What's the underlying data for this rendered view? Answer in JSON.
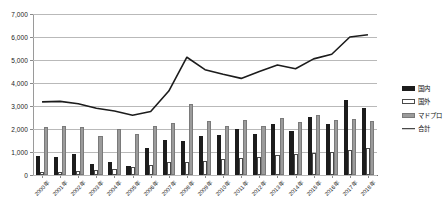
{
  "chart_data": {
    "type": "bar",
    "title": "",
    "subtitle": "",
    "xlabel": "",
    "ylabel": "",
    "ylim": [
      0,
      7000
    ],
    "ytick_step": 1000,
    "ytick_labels": [
      "0",
      "1,000",
      "2,000",
      "3,000",
      "4,000",
      "5,000",
      "6,000",
      "7,000"
    ],
    "ytick_values": [
      0,
      1000,
      2000,
      3000,
      4000,
      5000,
      6000,
      7000
    ],
    "grid": true,
    "legend_position": "right",
    "categories": [
      "2000年",
      "2001年",
      "2002年",
      "2003年",
      "2004年",
      "2005年",
      "2006年",
      "2007年",
      "2008年",
      "2009年",
      "2010年",
      "2011年",
      "2012年",
      "2013年",
      "2014年",
      "2015年",
      "2016年",
      "2017年",
      "2018年"
    ],
    "series": [
      {
        "name": "国内",
        "kind": "bar",
        "color": "#1c1c1c",
        "values": [
          830,
          780,
          900,
          480,
          560,
          400,
          1180,
          1520,
          1500,
          1680,
          1720,
          2000,
          1780,
          2200,
          1900,
          2520,
          2200,
          3280,
          2900
        ]
      },
      {
        "name": "国外",
        "kind": "bar",
        "color": "#ffffff",
        "values": [
          140,
          150,
          160,
          220,
          280,
          330,
          430,
          560,
          580,
          620,
          700,
          760,
          800,
          860,
          900,
          960,
          1000,
          1100,
          1180
        ]
      },
      {
        "name": "マドプロ",
        "kind": "bar",
        "color": "#9b9b9b",
        "values": [
          2070,
          2120,
          2100,
          1700,
          2000,
          1800,
          2120,
          2250,
          3080,
          2350,
          2120,
          2400,
          2150,
          2500,
          2300,
          2600,
          2400,
          2450,
          2350
        ]
      },
      {
        "name": "合計",
        "kind": "line",
        "color": "#1c1c1c",
        "values": [
          3180,
          3200,
          3100,
          2900,
          2780,
          2600,
          2760,
          3650,
          5120,
          4580,
          4380,
          4200,
          4500,
          4780,
          4620,
          5050,
          5250,
          6000,
          6100
        ]
      }
    ],
    "legend": [
      {
        "label": "国内",
        "swatch": "black-bar"
      },
      {
        "label": "国外",
        "swatch": "white-bar"
      },
      {
        "label": "マドプロ",
        "swatch": "gray-bar"
      },
      {
        "label": "合計",
        "swatch": "black-line"
      }
    ]
  }
}
